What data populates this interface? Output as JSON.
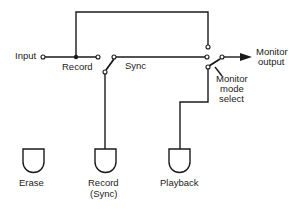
{
  "labels": {
    "input": "Input",
    "record": "Record",
    "sync": "Sync",
    "monitor_output_1": "Monitor",
    "monitor_output_2": "output",
    "monitor_mode_1": "Monitor",
    "monitor_mode_2": "mode",
    "monitor_mode_3": "select",
    "head_erase": "Erase",
    "head_record_1": "Record",
    "head_record_2": "(Sync)",
    "head_playback": "Playback"
  },
  "colors": {
    "line": "#1a1a1a",
    "background": "#ffffff"
  }
}
